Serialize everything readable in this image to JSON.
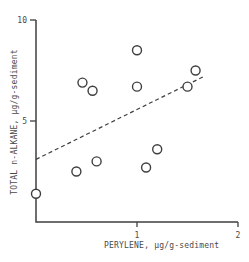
{
  "chart_data": {
    "type": "scatter",
    "title": "",
    "xlabel": "PERYLENE, μg/g-sediment",
    "ylabel": "TOTAL n-ALKANE, μg/g-sediment",
    "xlim": [
      0,
      2
    ],
    "ylim": [
      0,
      10
    ],
    "grid": false,
    "legend": "none",
    "x_ticks": [
      {
        "value": 1,
        "label": "1"
      },
      {
        "value": 2,
        "label": "2"
      }
    ],
    "y_ticks": [
      {
        "value": 5,
        "label": "5"
      },
      {
        "value": 10,
        "label": "10"
      }
    ],
    "points": [
      {
        "x": 0.0,
        "y": 1.4
      },
      {
        "x": 0.4,
        "y": 2.5
      },
      {
        "x": 0.46,
        "y": 6.9
      },
      {
        "x": 0.56,
        "y": 6.5
      },
      {
        "x": 0.6,
        "y": 3.0
      },
      {
        "x": 1.0,
        "y": 8.5
      },
      {
        "x": 1.0,
        "y": 6.7
      },
      {
        "x": 1.09,
        "y": 2.7
      },
      {
        "x": 1.2,
        "y": 3.6
      },
      {
        "x": 1.5,
        "y": 6.7
      },
      {
        "x": 1.58,
        "y": 7.5
      }
    ],
    "trend_line": {
      "style": "dashed",
      "x1": 0.0,
      "y1": 3.1,
      "x2": 1.66,
      "y2": 7.2
    },
    "marker": {
      "shape": "open-circle",
      "radius_px": 4.5
    },
    "colors": {
      "ink": "#3f3f3f",
      "text": "#4a4a4a",
      "background": "#ffffff"
    }
  }
}
